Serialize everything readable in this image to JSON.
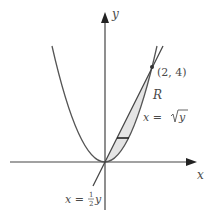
{
  "diagram": {
    "axes": {
      "x_label": "x",
      "y_label": "y"
    },
    "curves": [
      {
        "name": "parabola",
        "equation_label": "x = √y",
        "description": "y = x^2"
      },
      {
        "name": "line",
        "equation_label": "x = ½y",
        "description": "y = 2x"
      }
    ],
    "point": {
      "label": "(2, 4)",
      "x": 2,
      "y": 4
    },
    "region": {
      "label": "R",
      "fill": "#e4e4e4"
    },
    "labels": {
      "point": "(2, 4)",
      "region": "R",
      "sqrt_eq_prefix": "x = ",
      "sqrt_eq_radicand": "y",
      "line_eq_prefix": "x = ",
      "line_eq_num": "1",
      "line_eq_den": "2",
      "line_eq_var": "y"
    },
    "colors": {
      "stroke": "#555555",
      "axis": "#444444",
      "region": "#e4e4e4",
      "strip": "#222222"
    }
  }
}
